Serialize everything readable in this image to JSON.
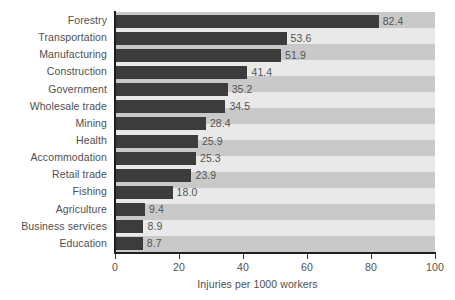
{
  "chart_data": {
    "type": "bar",
    "orientation": "horizontal",
    "title": "",
    "xlabel": "Injuries per 1000 workers",
    "ylabel": "",
    "xlim": [
      0,
      100
    ],
    "xticks": [
      "0",
      "20",
      "40",
      "60",
      "80",
      "100"
    ],
    "grid": false,
    "legend": null,
    "bar_color": "#3c3c3c",
    "band_color_dark": "#c9c9c9",
    "band_color_light": "#e9e9e9",
    "axis_color": "#1e1e1e",
    "text_color": "#4f4f4f",
    "categories": [
      "Forestry",
      "Transportation",
      "Manufacturing",
      "Construction",
      "Government",
      "Wholesale trade",
      "Mining",
      "Health",
      "Accommodation",
      "Retail trade",
      "Fishing",
      "Agriculture",
      "Business services",
      "Education"
    ],
    "values": [
      82.4,
      53.6,
      51.9,
      41.4,
      35.2,
      34.5,
      28.4,
      25.9,
      25.3,
      23.9,
      18.0,
      9.4,
      8.9,
      8.7
    ],
    "value_labels": [
      "82.4",
      "53.6",
      "51.9",
      "41.4",
      "35.2",
      "34.5",
      "28.4",
      "25.9",
      "25.3",
      "23.9",
      "18.0",
      "9.4",
      "8.9",
      "8.7"
    ]
  }
}
